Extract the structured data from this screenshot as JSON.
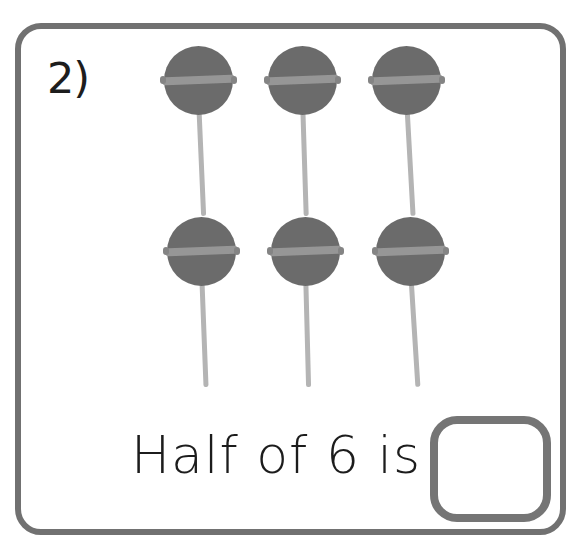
{
  "worksheet": {
    "question_number": "2)",
    "prompt_text": "Half of 6 is",
    "answer_value": "",
    "answer_placeholder": "",
    "total_objects": 6,
    "object_name": "lollipop",
    "rows": [
      {
        "row_label": "top-row",
        "count": 3
      },
      {
        "row_label": "bottom-row",
        "count": 3
      }
    ],
    "colors": {
      "frame_border": "#717171",
      "answer_box_border": "#757575",
      "candy_fill": "#6b6b6b",
      "candy_band": "#969696",
      "stick_fill": "#b4b4b4",
      "text": "#1c1c1c",
      "background": "#ffffff"
    },
    "icons": {
      "lollipop": "lollipop-icon"
    }
  }
}
